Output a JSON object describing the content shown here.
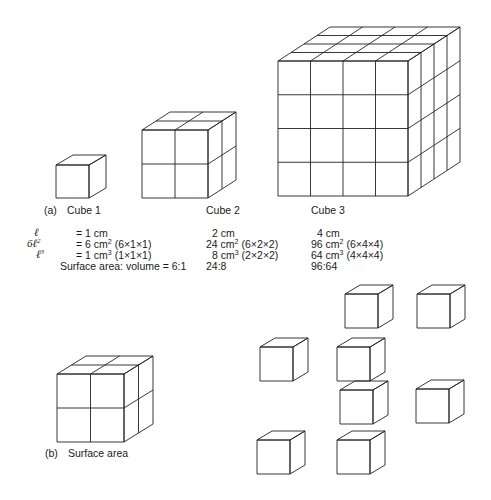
{
  "panel_a": {
    "tag": "(a)",
    "cube_labels": [
      "Cube 1",
      "Cube 2",
      "Cube 3"
    ],
    "rows": [
      {
        "symbol": "ℓ",
        "sup": "",
        "values": [
          {
            "main": "= 1 cm",
            "sup": "",
            "rest": ""
          },
          {
            "main": "2 cm",
            "sup": "",
            "rest": ""
          },
          {
            "main": "4 cm",
            "sup": "",
            "rest": ""
          }
        ]
      },
      {
        "symbol": "6ℓ",
        "sup": "2",
        "values": [
          {
            "main": "= 6 cm",
            "sup": "2",
            "rest": " (6×1×1)"
          },
          {
            "main": "24 cm",
            "sup": "2",
            "rest": " (6×2×2)"
          },
          {
            "main": "96 cm",
            "sup": "2",
            "rest": " (6×4×4)"
          }
        ]
      },
      {
        "symbol": "ℓ",
        "sup": "3",
        "values": [
          {
            "main": "= 1 cm",
            "sup": "3",
            "rest": " (1×1×1)"
          },
          {
            "main": "8 cm",
            "sup": "3",
            "rest": " (2×2×2)"
          },
          {
            "main": "64 cm",
            "sup": "3",
            "rest": " (4×4×4)"
          }
        ]
      }
    ],
    "ratio_row": {
      "label": "Surface area: volume = 6:1",
      "values": [
        "24:8",
        "96:64"
      ]
    }
  },
  "panel_b": {
    "tag": "(b)",
    "label": "Surface area",
    "separated_cube_count": 8
  },
  "colors": {
    "line": "#222222",
    "background": "#ffffff"
  }
}
